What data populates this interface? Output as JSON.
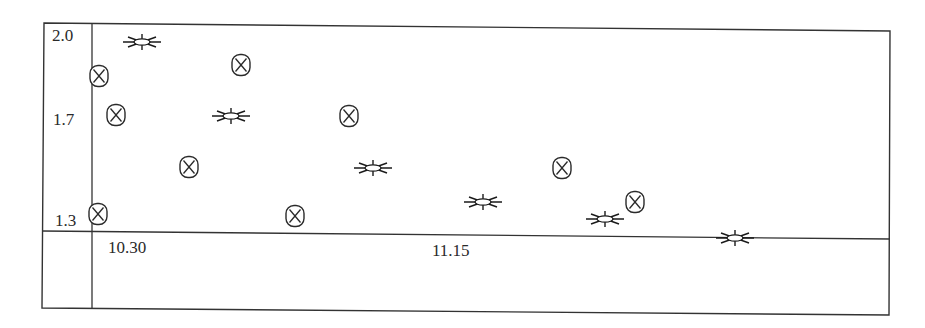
{
  "chart_data": {
    "type": "scatter",
    "title": "",
    "xlabel": "",
    "ylabel": "",
    "y_ticks": [
      "2.0",
      "1.7",
      "1.3"
    ],
    "x_ticks": [
      "10.30",
      "11.15"
    ],
    "ylim": [
      1.2,
      2.05
    ],
    "grid": false,
    "legend": null,
    "series": [
      {
        "name": "star",
        "marker": "star-burst",
        "points": [
          {
            "px": 142,
            "py": 42,
            "y": 2.0
          },
          {
            "px": 231,
            "py": 116,
            "y": 1.7
          },
          {
            "px": 373,
            "py": 168,
            "y": 1.5
          },
          {
            "px": 483,
            "py": 202,
            "y": 1.37
          },
          {
            "px": 605,
            "py": 219,
            "y": 1.3
          },
          {
            "px": 735,
            "py": 238,
            "y": 1.23
          }
        ]
      },
      {
        "name": "circled-x",
        "marker": "circled-cross",
        "points": [
          {
            "px": 99,
            "py": 76,
            "y": 1.86
          },
          {
            "px": 116,
            "py": 115,
            "y": 1.71
          },
          {
            "px": 98,
            "py": 214,
            "y": 1.32
          },
          {
            "px": 189,
            "py": 167,
            "y": 1.51
          },
          {
            "px": 241,
            "py": 65,
            "y": 1.9
          },
          {
            "px": 295,
            "py": 216,
            "y": 1.32
          },
          {
            "px": 349,
            "py": 116,
            "y": 1.7
          },
          {
            "px": 562,
            "py": 168,
            "y": 1.5
          },
          {
            "px": 635,
            "py": 202,
            "y": 1.37
          }
        ]
      }
    ]
  },
  "labels": {
    "y_top": "2.0",
    "y_mid": "1.7",
    "y_low": "1.3",
    "x_first": "10.30",
    "x_second": "11.15"
  }
}
